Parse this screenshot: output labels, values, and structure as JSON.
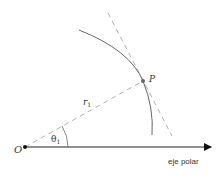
{
  "diagram": {
    "origin_label": "O",
    "point_label": "P",
    "radius_label_base": "r",
    "radius_label_sub": "1",
    "angle_label_base": "θ",
    "angle_label_sub": "1",
    "axis_label": "eje polar",
    "colors": {
      "axis": "#222222",
      "curve": "#666666",
      "dashed": "#aaaaaa",
      "point": "#666666",
      "origin": "#111111"
    }
  }
}
